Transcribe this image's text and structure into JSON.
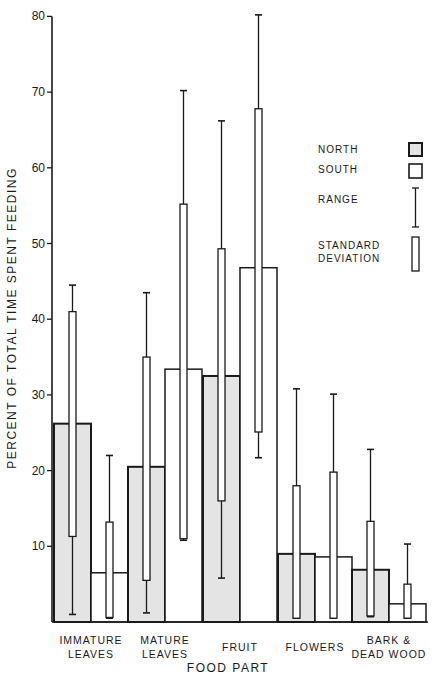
{
  "chart_data": {
    "type": "bar",
    "title": "",
    "xlabel": "FOOD PART",
    "ylabel": "PERCENT OF TOTAL TIME SPENT FEEDING",
    "ylim": [
      0,
      80
    ],
    "yticks": [
      10,
      20,
      30,
      40,
      50,
      60,
      70,
      80
    ],
    "grid": false,
    "legend_position": "upper right",
    "categories": [
      "IMMATURE LEAVES",
      "MATURE LEAVES",
      "FRUIT",
      "FLOWERS",
      "BARK & DEAD WOOD"
    ],
    "category_label_lines": [
      [
        "IMMATURE",
        "LEAVES"
      ],
      [
        "MATURE",
        "LEAVES"
      ],
      [
        "FRUIT"
      ],
      [
        "FLOWERS"
      ],
      [
        "BARK  &",
        "DEAD WOOD"
      ]
    ],
    "series": [
      {
        "name": "NORTH",
        "fill": "#e4e4e4",
        "values": [
          26.2,
          20.5,
          32.5,
          9.0,
          6.9
        ],
        "sd_low": [
          11.3,
          5.5,
          16.0,
          0.5,
          0.8
        ],
        "sd_high": [
          41.0,
          35.0,
          49.3,
          18.0,
          13.3
        ],
        "range_low": [
          1.0,
          1.2,
          5.8,
          0.5,
          0.7
        ],
        "range_high": [
          44.5,
          43.5,
          66.2,
          30.8,
          22.8
        ]
      },
      {
        "name": "SOUTH",
        "fill": "#ffffff",
        "values": [
          6.5,
          33.4,
          46.8,
          8.6,
          2.4
        ],
        "sd_low": [
          0.6,
          11.0,
          25.1,
          0.5,
          0.5
        ],
        "sd_high": [
          13.2,
          55.2,
          67.8,
          19.8,
          5.0
        ],
        "range_low": [
          0.5,
          10.8,
          21.7,
          0.5,
          0.5
        ],
        "range_high": [
          22.0,
          70.2,
          80.2,
          30.1,
          10.3
        ]
      }
    ]
  },
  "legend": {
    "north": "NORTH",
    "south": "SOUTH",
    "range": "RANGE",
    "sd_line1": "STANDARD",
    "sd_line2": "DEVIATION"
  },
  "axis": {
    "xlabel": "FOOD PART",
    "ylabel": "PERCENT OF TOTAL TIME SPENT FEEDING"
  }
}
